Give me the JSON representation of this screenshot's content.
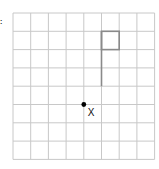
{
  "figure": {
    "marker_label": ":",
    "grid": {
      "columns": 8,
      "rows": 8,
      "origin_x": 13,
      "origin_y": 13,
      "cell_w": 17.7,
      "cell_h": 18.3,
      "line_color": "#c8c8c8"
    },
    "flag": {
      "pole": {
        "col": 5,
        "row_start": 1,
        "row_end": 4
      },
      "box": {
        "col": 5,
        "row": 1,
        "width_cells": 1,
        "height_cells": 1
      },
      "color": "#8a8a8a"
    },
    "point": {
      "col": 4,
      "row": 5,
      "label": "X",
      "color": "#000000"
    }
  }
}
